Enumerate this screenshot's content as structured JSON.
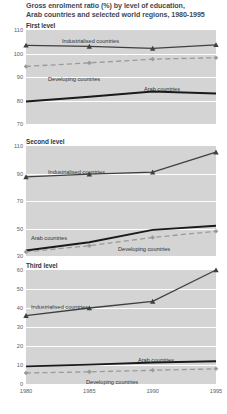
{
  "title": {
    "line1": "Gross enrolment ratio (%) by level of education,",
    "line2": "Arab countries and selected world regions, 1980-1995"
  },
  "colors": {
    "plot_background": "#d4d4d4",
    "gridline": "#ffffff",
    "industrialised": "#3f3f3f",
    "arab": "#1a1a1a",
    "developing": "#9a9a9a",
    "tick_text": "#55606a",
    "title_text": "#3d4a56"
  },
  "axis": {
    "x_ticks": [
      "1980",
      "1985",
      "1990",
      "1995"
    ]
  },
  "series_labels": {
    "industrialised": "Industrialised countries",
    "arab": "Arab countries",
    "developing": "Developing countries"
  },
  "chart_data": [
    {
      "type": "line",
      "title": "First level",
      "xlabel": "",
      "ylabel": "",
      "x": [
        1980,
        1985,
        1990,
        1995
      ],
      "ylim": [
        70,
        110
      ],
      "yticks": [
        110,
        100,
        90,
        80,
        70
      ],
      "grid": true,
      "legend": "inline-labels",
      "series": [
        {
          "name": "Industrialised countries",
          "values": [
            103.5,
            103.0,
            102.2,
            103.7
          ],
          "style": "solid",
          "marker": "triangle"
        },
        {
          "name": "Developing countries",
          "values": [
            94.5,
            96.0,
            97.6,
            98.2
          ],
          "style": "dashed",
          "marker": "diamond"
        },
        {
          "name": "Arab countries",
          "values": [
            79.6,
            81.6,
            83.8,
            83.0
          ],
          "style": "solid-thick",
          "marker": "none"
        }
      ]
    },
    {
      "type": "line",
      "title": "Second level",
      "xlabel": "",
      "ylabel": "",
      "x": [
        1980,
        1985,
        1990,
        1995
      ],
      "ylim": [
        30,
        110
      ],
      "yticks": [
        110,
        90,
        70,
        50,
        30
      ],
      "grid": true,
      "legend": "inline-labels",
      "series": [
        {
          "name": "Industrialised countries",
          "values": [
            87.5,
            89.5,
            91.0,
            105.5
          ],
          "style": "solid",
          "marker": "triangle"
        },
        {
          "name": "Arab countries",
          "values": [
            34.0,
            40.0,
            49.0,
            52.0
          ],
          "style": "solid-thick",
          "marker": "none"
        },
        {
          "name": "Developing countries",
          "values": [
            33.0,
            37.5,
            43.5,
            48.0
          ],
          "style": "dashed",
          "marker": "diamond"
        }
      ]
    },
    {
      "type": "line",
      "title": "Third level",
      "xlabel": "",
      "ylabel": "",
      "x": [
        1980,
        1985,
        1990,
        1995
      ],
      "ylim": [
        0,
        60
      ],
      "yticks": [
        60,
        50,
        40,
        30,
        20,
        10,
        0
      ],
      "grid": true,
      "legend": "inline-labels",
      "series": [
        {
          "name": "Industrialised countries",
          "values": [
            36.0,
            40.0,
            43.5,
            60.0
          ],
          "style": "solid",
          "marker": "triangle"
        },
        {
          "name": "Arab countries",
          "values": [
            9.3,
            10.2,
            11.3,
            12.0
          ],
          "style": "solid-thick",
          "marker": "none"
        },
        {
          "name": "Developing countries",
          "values": [
            5.8,
            6.4,
            7.2,
            8.0
          ],
          "style": "dashed",
          "marker": "diamond"
        }
      ]
    }
  ]
}
